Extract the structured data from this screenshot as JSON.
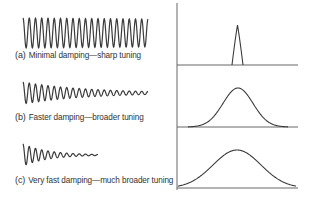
{
  "panels": [
    {
      "tag": "(a)",
      "label": "Minimal damping—sharp tuning",
      "damping": "minimal",
      "cycles": 20,
      "curve": "very narrow resonance peak"
    },
    {
      "tag": "(b)",
      "label": "Faster damping—broader tuning",
      "damping": "faster",
      "cycles": 20,
      "curve": "moderately broad resonance peak"
    },
    {
      "tag": "(c)",
      "label": "Very fast damping—much broader tuning",
      "damping": "very fast",
      "cycles": 12,
      "curve": "very broad resonance peak"
    }
  ],
  "colors": {
    "line": "#3a3a3a",
    "axis": "#555555",
    "text": "#333333"
  }
}
